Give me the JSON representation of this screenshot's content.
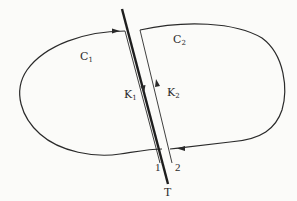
{
  "diagram": {
    "type": "contour-with-cut",
    "colors": {
      "background": "#fbfbf9",
      "stroke": "#2a2a2a"
    },
    "labels": {
      "c1": {
        "base": "C",
        "sub": "1"
      },
      "c2": {
        "base": "C",
        "sub": "2"
      },
      "k1": {
        "base": "K",
        "sub": "1"
      },
      "k2": {
        "base": "K",
        "sub": "2"
      },
      "edge_1": "1",
      "edge_2": "2",
      "cut_t": "T"
    },
    "elements": {
      "closed_contour": "Closed curve C split into C1 (left) and C2 (right) by cut T",
      "cut_line": "Thick line T crossing the contour",
      "edge_1_path": "Thin line 1 on left side of T, direction downward (K1)",
      "edge_2_path": "Thin line 2 on right side of T, direction upward (K2)",
      "arrows": [
        "rightward arrow on top of contour near cut (C1 side)",
        "leftward arrow on bottom of contour near cut (C2 side)",
        "downward arrow on edge 1 (K1)",
        "upward arrow on edge 2 (K2)"
      ]
    }
  }
}
